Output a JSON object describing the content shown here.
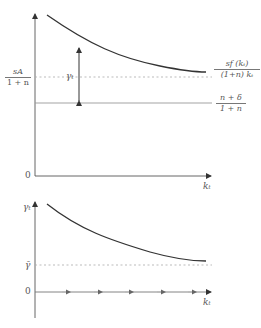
{
  "upper_panel": {
    "y_axis_label": "",
    "x_axis_label": "k_t",
    "x_axis_label_display": "kₜ",
    "origin_label": "0",
    "curve_label": {
      "numerator": "sf (kₜ)",
      "denominator": "(1+n) kₜ"
    },
    "asymptote_label": {
      "numerator": "sA",
      "denominator": "1 + n"
    },
    "line_label": {
      "numerator": "n + δ",
      "denominator": "1 + n"
    },
    "gap_label": "γₜ",
    "colors": {
      "curve": "#333333",
      "axis": "#444444",
      "dotted": "#aaaaaa",
      "line": "#999999"
    }
  },
  "lower_panel": {
    "y_axis_label": "γₜ",
    "x_axis_label": "kₜ",
    "origin_label": "0",
    "asymptote_label": "γ̄",
    "arrow_count": 5
  }
}
